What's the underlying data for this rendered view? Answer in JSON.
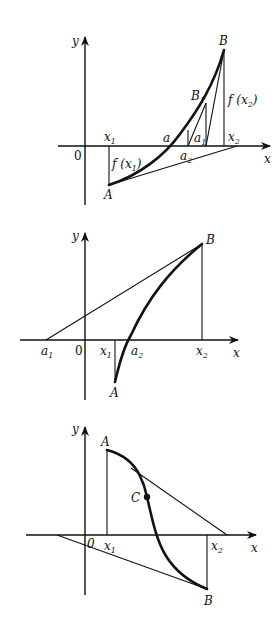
{
  "figures": [
    {
      "id": "fig1",
      "description": "Chord method convergence, convex increasing curve",
      "labels": {
        "y_axis": "y",
        "x_axis": "x",
        "origin": "0",
        "x1": {
          "base": "x",
          "sub": "1"
        },
        "x2": {
          "base": "x",
          "sub": "2"
        },
        "a": "a",
        "a1": {
          "base": "a",
          "sub": "1"
        },
        "a2": {
          "base": "a",
          "sub": "2"
        },
        "B": "B",
        "B1": {
          "base": "B",
          "sub": "1"
        },
        "A": "A",
        "fx1": {
          "pre": "f (x",
          "sub": "1",
          "post": ")"
        },
        "fx2": {
          "pre": "f (x",
          "sub": "2",
          "post": ")"
        }
      }
    },
    {
      "id": "fig2",
      "description": "Tangent/secant construction, concave increasing curve",
      "labels": {
        "y_axis": "y",
        "x_axis": "x",
        "origin": "0",
        "a1": {
          "base": "a",
          "sub": "1"
        },
        "x1": {
          "base": "x",
          "sub": "1"
        },
        "a2": {
          "base": "a",
          "sub": "2"
        },
        "x2": {
          "base": "x",
          "sub": "2"
        },
        "B": "B",
        "A": "A"
      }
    },
    {
      "id": "fig3",
      "description": "Curve with inflection point C, decreasing from A to B",
      "labels": {
        "y_axis": "y",
        "x_axis": "x",
        "origin": "0",
        "x1": {
          "base": "x",
          "sub": "1"
        },
        "x2": {
          "base": "x",
          "sub": "2"
        },
        "A": "A",
        "B": "B",
        "C": "C"
      }
    }
  ]
}
